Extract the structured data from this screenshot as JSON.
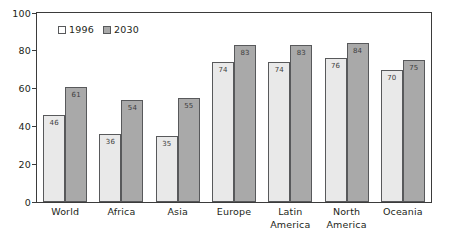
{
  "chart_data": {
    "type": "bar",
    "title": "",
    "subtitle": "",
    "xlabel": "",
    "ylabel": "",
    "ylim": [
      0,
      100
    ],
    "yticks": [
      0,
      20,
      40,
      60,
      80,
      100
    ],
    "grid": false,
    "legend_position": "top-left",
    "categories": [
      "World",
      "Africa",
      "Asia",
      "Europe",
      "Latin\nAmerica",
      "North\nAmerica",
      "Oceania"
    ],
    "category_lines": [
      [
        "World"
      ],
      [
        "Africa"
      ],
      [
        "Asia"
      ],
      [
        "Europe"
      ],
      [
        "Latin",
        "America"
      ],
      [
        "North",
        "America"
      ],
      [
        "Oceania"
      ]
    ],
    "series": [
      {
        "name": "1996",
        "color": "#e9e9e9",
        "values": [
          46,
          36,
          35,
          74,
          74,
          76,
          70
        ]
      },
      {
        "name": "2030",
        "color": "#a9a9a9",
        "values": [
          61,
          54,
          55,
          83,
          83,
          84,
          75
        ]
      }
    ]
  },
  "legend": {
    "items": [
      {
        "label": "1996"
      },
      {
        "label": "2030"
      }
    ]
  },
  "axis": {
    "y_tick_labels": [
      "100",
      "80",
      "60",
      "40",
      "20",
      "0"
    ]
  }
}
